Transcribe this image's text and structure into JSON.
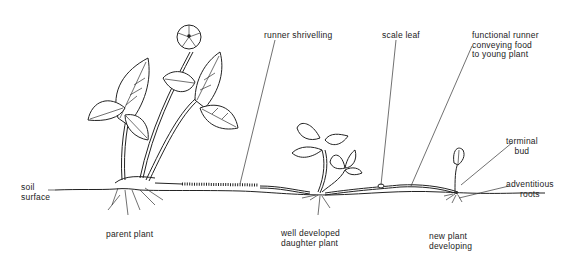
{
  "diagram": {
    "labels": {
      "soil_surface": [
        "soil",
        "surface"
      ],
      "parent_plant": "parent plant",
      "runner_shrivelling": "runner shrivelling",
      "scale_leaf": "scale leaf",
      "functional_runner": [
        "functional runner",
        "conveying food",
        "to young plant"
      ],
      "terminal_bud": [
        "terminal",
        "bud"
      ],
      "adventitious_roots": [
        "adventitious",
        "roots"
      ],
      "daughter_plant": [
        "well developed",
        "daughter plant"
      ],
      "new_plant": [
        "new plant",
        "developing"
      ]
    },
    "colors": {
      "ink": "#222222",
      "background": "#ffffff"
    }
  }
}
